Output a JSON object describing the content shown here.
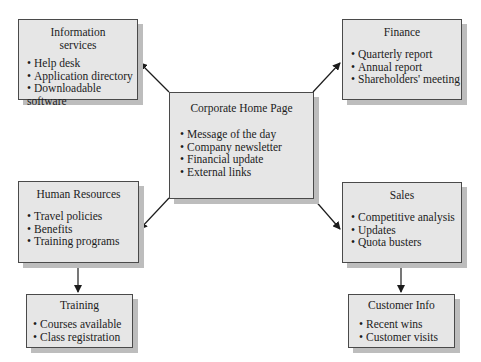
{
  "diagram": {
    "center": {
      "title": "Corporate Home Page",
      "items": [
        "Message of the day",
        "Company newsletter",
        "Financial update",
        "External links"
      ]
    },
    "info_services": {
      "title_line1": "Information",
      "title_line2": "services",
      "items": [
        "Help desk",
        "Application directory",
        "Downloadable software"
      ]
    },
    "finance": {
      "title": "Finance",
      "items": [
        "Quarterly report",
        "Annual report",
        "Shareholders' meeting"
      ]
    },
    "human_resources": {
      "title": "Human Resources",
      "items": [
        "Travel policies",
        "Benefits",
        "Training programs"
      ]
    },
    "sales": {
      "title": "Sales",
      "items": [
        "Competitive analysis",
        "Updates",
        "Quota busters"
      ]
    },
    "training": {
      "title": "Training",
      "items": [
        "Courses available",
        "Class registration"
      ]
    },
    "customer_info": {
      "title": "Customer Info",
      "items": [
        "Recent wins",
        "Customer visits"
      ]
    },
    "edges": [
      {
        "from": "Corporate Home Page",
        "to": "Information services"
      },
      {
        "from": "Corporate Home Page",
        "to": "Finance"
      },
      {
        "from": "Corporate Home Page",
        "to": "Human Resources"
      },
      {
        "from": "Corporate Home Page",
        "to": "Sales"
      },
      {
        "from": "Human Resources",
        "to": "Training"
      },
      {
        "from": "Sales",
        "to": "Customer Info"
      }
    ]
  }
}
